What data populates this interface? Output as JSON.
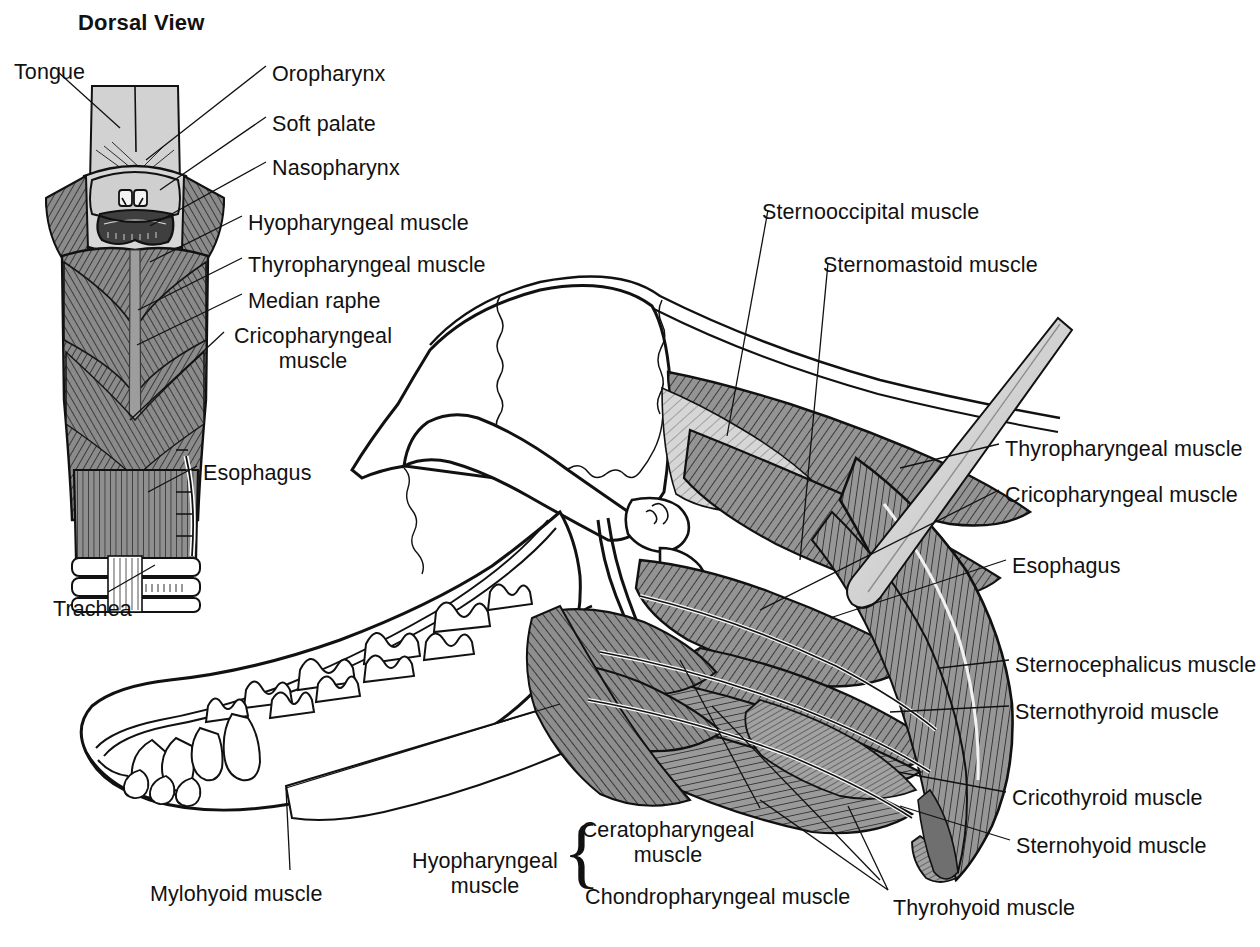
{
  "figure": {
    "title": "Dorsal View",
    "background_color": "#ffffff",
    "ink_color": "#111111",
    "muscle_fill": "#8e8e8e",
    "muscle_fill_light": "#b9b9b9",
    "muscle_fill_dark": "#6f6f6f",
    "pale_fill": "#d9d9d9",
    "bone_fill": "#ffffff"
  },
  "inset_labels": [
    {
      "id": "tongue",
      "text": "Tongue",
      "x": 14,
      "y": 60,
      "align": "left"
    },
    {
      "id": "oropharynx",
      "text": "Oropharynx",
      "x": 272,
      "y": 62,
      "align": "left"
    },
    {
      "id": "soft-palate",
      "text": "Soft palate",
      "x": 272,
      "y": 112,
      "align": "left"
    },
    {
      "id": "nasopharynx",
      "text": "Nasopharynx",
      "x": 272,
      "y": 156,
      "align": "left"
    },
    {
      "id": "hyopharyngeal",
      "text": "Hyopharyngeal muscle",
      "x": 248,
      "y": 211,
      "align": "left"
    },
    {
      "id": "thyropharyngeal",
      "text": "Thyropharyngeal muscle",
      "x": 248,
      "y": 253,
      "align": "left"
    },
    {
      "id": "median-raphe",
      "text": "Median raphe",
      "x": 248,
      "y": 289,
      "align": "left"
    },
    {
      "id": "cricopharyngeal",
      "text": "Cricopharyngeal\nmuscle",
      "x": 230,
      "y": 324,
      "align": "left"
    },
    {
      "id": "esophagus-inset",
      "text": "Esophagus",
      "x": 203,
      "y": 461,
      "align": "left"
    },
    {
      "id": "trachea",
      "text": "Trachea",
      "x": 53,
      "y": 597,
      "align": "left"
    }
  ],
  "main_labels": [
    {
      "id": "sternooccipital",
      "text": "Sternooccipital muscle",
      "x": 762,
      "y": 200,
      "align": "left"
    },
    {
      "id": "sternomastoid",
      "text": "Sternomastoid muscle",
      "x": 823,
      "y": 253,
      "align": "left"
    },
    {
      "id": "thyropharyngeal-r",
      "text": "Thyropharyngeal muscle",
      "x": 1005,
      "y": 437,
      "align": "left"
    },
    {
      "id": "cricopharyngeal-r",
      "text": "Cricopharyngeal muscle",
      "x": 1005,
      "y": 483,
      "align": "left"
    },
    {
      "id": "esophagus-r",
      "text": "Esophagus",
      "x": 1012,
      "y": 554,
      "align": "left"
    },
    {
      "id": "sternocephalicus",
      "text": "Sternocephalicus muscle",
      "x": 1015,
      "y": 653,
      "align": "left"
    },
    {
      "id": "sternothyroid",
      "text": "Sternothyroid muscle",
      "x": 1015,
      "y": 700,
      "align": "left"
    },
    {
      "id": "cricothyroid",
      "text": "Cricothyroid muscle",
      "x": 1012,
      "y": 786,
      "align": "left"
    },
    {
      "id": "sternohyoid",
      "text": "Sternohyoid muscle",
      "x": 1016,
      "y": 834,
      "align": "left"
    },
    {
      "id": "mylohyoid",
      "text": "Mylohyoid muscle",
      "x": 150,
      "y": 882,
      "align": "left"
    },
    {
      "id": "thyrohyoid",
      "text": "Thyrohyoid muscle",
      "x": 893,
      "y": 896,
      "align": "left"
    }
  ],
  "bracket_group": {
    "id": "hyopharyngeal-group",
    "label": "Hyopharyngeal\nmuscle",
    "label_x": 412,
    "label_y": 849,
    "brace_x": 563,
    "brace_y": 814,
    "members": [
      {
        "id": "ceratopharyngeal",
        "text": "Ceratopharyngeal\nmuscle",
        "x": 585,
        "y": 818
      },
      {
        "id": "chondropharyngeal",
        "text": "Chondropharyngeal muscle",
        "x": 585,
        "y": 885
      }
    ]
  }
}
